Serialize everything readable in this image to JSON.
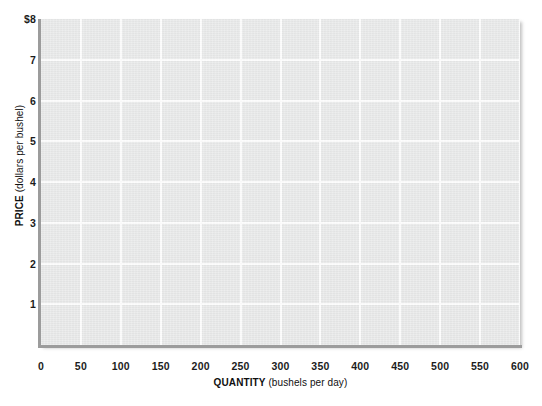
{
  "chart_data": {
    "type": "line",
    "title": "",
    "subtitle": "",
    "xlabel_bold": "QUANTITY",
    "xlabel_unit": "(bushels per day)",
    "ylabel_bold": "PRICE",
    "ylabel_unit": "(dollars per bushel)",
    "xlim": [
      0,
      600
    ],
    "ylim": [
      0,
      8
    ],
    "x_ticks": [
      "0",
      "50",
      "100",
      "150",
      "200",
      "250",
      "300",
      "350",
      "400",
      "450",
      "500",
      "550",
      "600"
    ],
    "x_tick_values": [
      0,
      50,
      100,
      150,
      200,
      250,
      300,
      350,
      400,
      450,
      500,
      550,
      600
    ],
    "y_ticks": [
      "1",
      "2",
      "3",
      "4",
      "5",
      "6",
      "7",
      "$8"
    ],
    "y_tick_values": [
      1,
      2,
      3,
      4,
      5,
      6,
      7,
      8
    ],
    "grid": true,
    "legend": "none",
    "series": [],
    "annotations": [],
    "colors": {
      "plot_background": "#e7e8e8",
      "gridline": "#fdfdfd",
      "axis_line": "#9c9c9c",
      "tick_label": "#1c1c1c",
      "axis_title": "#101010",
      "page_background": "#ffffff"
    }
  }
}
